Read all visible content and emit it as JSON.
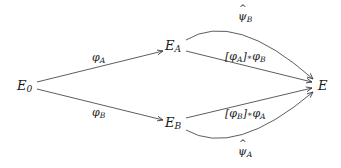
{
  "nodes": {
    "E0": {
      "main": "E",
      "sub": "0"
    },
    "EA": {
      "main": "E",
      "sub": "A"
    },
    "EB": {
      "main": "E",
      "sub": "B"
    },
    "E": {
      "main": "E",
      "sub": ""
    }
  },
  "edges": {
    "phiA": {
      "main": "φ",
      "sub": "A",
      "from": "E0",
      "to": "EA"
    },
    "phiB": {
      "main": "φ",
      "sub": "B",
      "from": "E0",
      "to": "EB"
    },
    "psiB": {
      "main": "ψ",
      "sub": "B",
      "from": "EA",
      "to": "E",
      "hat": true,
      "curved": "up"
    },
    "phiA_star_phiB": {
      "bracket_main": "φ",
      "bracket_sub": "A",
      "op": "∗",
      "main": "φ",
      "sub": "B",
      "from": "EA",
      "to": "E"
    },
    "phiB_star_phiA": {
      "bracket_main": "φ",
      "bracket_sub": "B",
      "op": "∗",
      "main": "φ",
      "sub": "A",
      "from": "EB",
      "to": "E"
    },
    "psiA": {
      "main": "ψ",
      "sub": "A",
      "from": "EB",
      "to": "E",
      "hat": true,
      "curved": "down"
    }
  },
  "colors": {
    "stroke": "#333333",
    "text": "#1a1a1a"
  }
}
